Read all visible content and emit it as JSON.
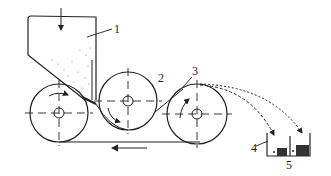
{
  "diagram": {
    "labels": [
      {
        "id": "1",
        "text": "1",
        "refers_to": "hopper"
      },
      {
        "id": "2",
        "text": "2",
        "refers_to": "middle-roller"
      },
      {
        "id": "3",
        "text": "3",
        "refers_to": "separating-roller"
      },
      {
        "id": "4",
        "text": "4",
        "refers_to": "collection-bin"
      },
      {
        "id": "5",
        "text": "5",
        "refers_to": "bin-divider"
      }
    ],
    "components": {
      "hopper": {
        "feed_arrow": "down"
      },
      "rollers": [
        {
          "name": "left-roller",
          "rotation": "clockwise"
        },
        {
          "name": "middle-roller",
          "rotation": "clockwise"
        },
        {
          "name": "right-roller",
          "rotation": "clockwise"
        }
      ],
      "belt": {
        "return_direction": "left"
      },
      "trajectories": [
        "near-fraction",
        "far-fraction"
      ],
      "bin": {
        "compartments": 2
      }
    },
    "colors": {
      "line": "#222222",
      "background": "#ffffff"
    }
  }
}
